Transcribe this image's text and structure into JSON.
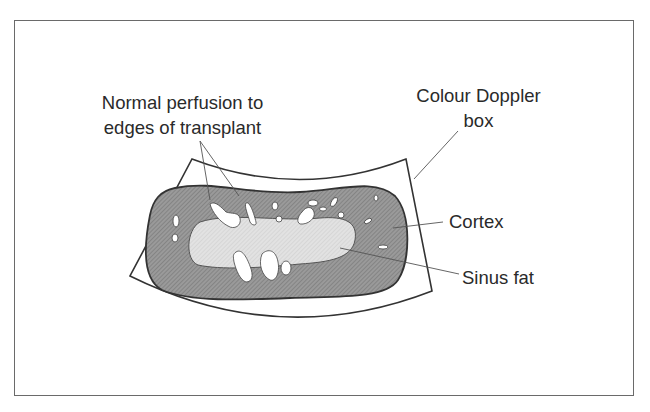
{
  "figure": {
    "type": "Transplant kidney colour Doppler ultrasound schematic",
    "colors": {
      "frame_border": "#6a6a6a",
      "cortex_fill": "#8e8e8e",
      "sinus_fat_fill": "#d8d8d8",
      "vessel_fill": "#ffffff",
      "outline": "#333333",
      "leader_line": "#555555",
      "text": "#2a2a2a"
    }
  },
  "labels": {
    "perfusion": {
      "line1": "Normal perfusion to",
      "line2": "edges of transplant"
    },
    "doppler_box": {
      "line1": "Colour Doppler",
      "line2": "box"
    },
    "cortex": "Cortex",
    "sinus_fat": "Sinus fat"
  }
}
